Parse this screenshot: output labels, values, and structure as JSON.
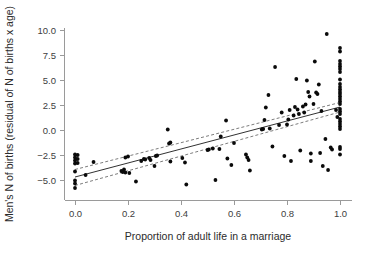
{
  "chart_data": {
    "type": "scatter",
    "title": "",
    "xlabel": "Proportion of adult life in a marriage",
    "ylabel": "Men's N of births (residual of N of births x age)",
    "xlim": [
      -0.06,
      1.08
    ],
    "ylim": [
      -6.6,
      10.9
    ],
    "xticks": [
      0.0,
      0.2,
      0.4,
      0.6,
      0.8,
      1.0
    ],
    "xticklabels": [
      "0.0",
      "0.2",
      "0.4",
      "0.6",
      "0.8",
      "1.0"
    ],
    "yticks": [
      -5.0,
      -2.5,
      0.0,
      2.5,
      5.0,
      7.5,
      10.0
    ],
    "yticklabels": [
      "−5.0",
      "−2.5",
      "0.0",
      "2.5",
      "5.0",
      "7.5",
      "10.0"
    ],
    "grid": false,
    "legend": null,
    "marker": "filled-circle",
    "marker_color": "#0a0a0a",
    "points": [
      [
        0.0,
        -2.45
      ],
      [
        0.0,
        -2.75
      ],
      [
        0.0,
        -3.05
      ],
      [
        0.0,
        -3.35
      ],
      [
        0.0,
        -4.15
      ],
      [
        0.0,
        -5.05
      ],
      [
        0.0,
        -5.35
      ],
      [
        0.0,
        -5.8
      ],
      [
        0.01,
        -2.5
      ],
      [
        0.01,
        -2.9
      ],
      [
        0.01,
        -3.3
      ],
      [
        0.04,
        -4.5
      ],
      [
        0.07,
        -3.2
      ],
      [
        0.175,
        -4.1
      ],
      [
        0.18,
        -4.2
      ],
      [
        0.185,
        -3.95
      ],
      [
        0.19,
        -4.25
      ],
      [
        0.19,
        -2.75
      ],
      [
        0.2,
        -2.65
      ],
      [
        0.205,
        -4.3
      ],
      [
        0.23,
        -5.15
      ],
      [
        0.25,
        -3.1
      ],
      [
        0.26,
        -2.9
      ],
      [
        0.265,
        -2.95
      ],
      [
        0.28,
        -2.8
      ],
      [
        0.285,
        -3.0
      ],
      [
        0.3,
        -3.6
      ],
      [
        0.305,
        -2.6
      ],
      [
        0.31,
        -2.55
      ],
      [
        0.35,
        0.05
      ],
      [
        0.355,
        -1.35
      ],
      [
        0.36,
        -1.25
      ],
      [
        0.36,
        -3.15
      ],
      [
        0.405,
        -2.8
      ],
      [
        0.415,
        -3.25
      ],
      [
        0.42,
        -5.45
      ],
      [
        0.5,
        -2.0
      ],
      [
        0.505,
        -1.95
      ],
      [
        0.52,
        -1.85
      ],
      [
        0.53,
        -5.0
      ],
      [
        0.545,
        -1.9
      ],
      [
        0.55,
        -0.65
      ],
      [
        0.57,
        0.95
      ],
      [
        0.575,
        -2.85
      ],
      [
        0.59,
        -3.5
      ],
      [
        0.6,
        -1.3
      ],
      [
        0.645,
        -2.45
      ],
      [
        0.65,
        -2.75
      ],
      [
        0.655,
        -3.0
      ],
      [
        0.66,
        -4.05
      ],
      [
        0.705,
        0.05
      ],
      [
        0.71,
        0.1
      ],
      [
        0.715,
        1.0
      ],
      [
        0.72,
        2.25
      ],
      [
        0.73,
        3.5
      ],
      [
        0.735,
        0.15
      ],
      [
        0.745,
        -1.65
      ],
      [
        0.755,
        6.3
      ],
      [
        0.77,
        0.5
      ],
      [
        0.78,
        1.75
      ],
      [
        0.79,
        -2.6
      ],
      [
        0.8,
        0.55
      ],
      [
        0.805,
        1.05
      ],
      [
        0.81,
        2.0
      ],
      [
        0.815,
        -3.1
      ],
      [
        0.825,
        1.45
      ],
      [
        0.83,
        2.3
      ],
      [
        0.835,
        5.1
      ],
      [
        0.84,
        2.05
      ],
      [
        0.845,
        1.6
      ],
      [
        0.85,
        -2.05
      ],
      [
        0.86,
        2.35
      ],
      [
        0.865,
        1.75
      ],
      [
        0.87,
        2.55
      ],
      [
        0.875,
        4.95
      ],
      [
        0.88,
        3.8
      ],
      [
        0.885,
        3.35
      ],
      [
        0.89,
        -3.1
      ],
      [
        0.89,
        -2.35
      ],
      [
        0.9,
        2.6
      ],
      [
        0.905,
        6.85
      ],
      [
        0.91,
        3.75
      ],
      [
        0.915,
        3.6
      ],
      [
        0.92,
        4.55
      ],
      [
        0.925,
        -2.3
      ],
      [
        0.93,
        1.9
      ],
      [
        0.935,
        -3.6
      ],
      [
        0.945,
        -0.9
      ],
      [
        0.95,
        9.6
      ],
      [
        0.955,
        -4.0
      ],
      [
        0.965,
        -1.75
      ],
      [
        0.97,
        -1.95
      ],
      [
        0.985,
        2.0
      ],
      [
        0.99,
        1.3
      ],
      [
        1.0,
        8.2
      ],
      [
        1.0,
        7.85
      ],
      [
        1.0,
        6.9
      ],
      [
        1.0,
        6.6
      ],
      [
        1.0,
        6.35
      ],
      [
        1.0,
        6.1
      ],
      [
        1.0,
        5.8
      ],
      [
        1.0,
        5.05
      ],
      [
        1.0,
        4.6
      ],
      [
        1.0,
        4.3
      ],
      [
        1.0,
        4.05
      ],
      [
        1.0,
        3.8
      ],
      [
        1.0,
        3.6
      ],
      [
        1.0,
        3.35
      ],
      [
        1.0,
        3.1
      ],
      [
        1.0,
        2.85
      ],
      [
        1.0,
        2.6
      ],
      [
        1.0,
        2.1
      ],
      [
        1.0,
        1.85
      ],
      [
        1.0,
        1.6
      ],
      [
        1.0,
        1.1
      ],
      [
        1.0,
        0.85
      ],
      [
        1.0,
        0.6
      ],
      [
        1.0,
        0.35
      ],
      [
        1.0,
        0.1
      ],
      [
        1.0,
        -1.7
      ],
      [
        1.0,
        -1.9
      ],
      [
        1.0,
        -2.45
      ]
    ],
    "fit_line": {
      "style": "solid",
      "x": [
        0.0,
        1.0
      ],
      "y": [
        -4.7,
        2.3
      ],
      "label": "regression line"
    },
    "confidence_band": {
      "style": "dashed",
      "upper": {
        "x": [
          0.0,
          1.0
        ],
        "y": [
          -3.95,
          2.75
        ]
      },
      "lower": {
        "x": [
          0.0,
          1.0
        ],
        "y": [
          -5.55,
          1.8
        ]
      },
      "label": "confidence interval"
    }
  }
}
